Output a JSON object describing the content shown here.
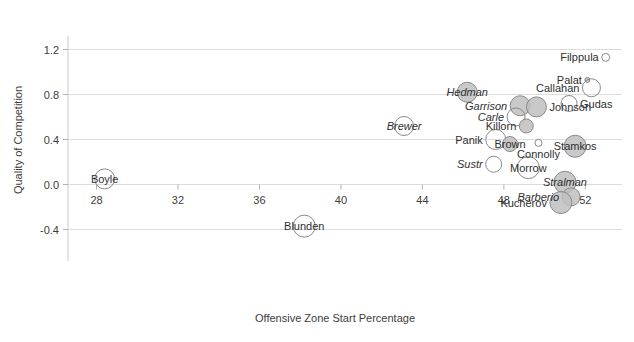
{
  "chart_data": {
    "type": "scatter",
    "title": "",
    "subtitle": "",
    "xlabel": "Offensive Zone Start Percentage",
    "ylabel": "Quality of Competition",
    "xlim": [
      26.6,
      53.8
    ],
    "ylim": [
      -0.52,
      1.32
    ],
    "xticks": [
      28,
      32,
      36,
      40,
      44,
      48,
      52
    ],
    "yticks": [
      1.2,
      0.8,
      0.4,
      0.0,
      -0.4
    ],
    "xtick_labels": [
      "28",
      "32",
      "36",
      "40",
      "44",
      "48",
      "52"
    ],
    "ytick_labels": [
      "1.2",
      "0.8",
      "0.4",
      "0.0",
      "-0.4"
    ],
    "grid": true,
    "grid_axis": "y",
    "legend": "none",
    "legend_position": "none",
    "marker_shape": "circle",
    "size_encoding": "bubble area (time on ice)",
    "style_note": "italic labels denote defensemen; shaded bubbles vs open bubbles",
    "colors": {
      "bubble_fill": "#bfbfbf",
      "bubble_stroke": "#8a8a8a",
      "grid": "#dcdcdc",
      "axis": "#c9c9c9",
      "text": "#3c3c3c"
    },
    "points": [
      {
        "label": "Filppula",
        "x": 53.0,
        "y": 1.13,
        "r": 4,
        "filled": false,
        "italic": false,
        "label_side": "left"
      },
      {
        "label": "Palat",
        "x": 52.1,
        "y": 0.93,
        "r": 2.5,
        "filled": true,
        "italic": false,
        "label_side": "left"
      },
      {
        "label": "Callahan",
        "x": 52.3,
        "y": 0.86,
        "r": 9,
        "filled": false,
        "italic": false,
        "label_side": "left"
      },
      {
        "label": "Hedman",
        "x": 46.2,
        "y": 0.82,
        "r": 10,
        "filled": true,
        "italic": true,
        "label_side": "center"
      },
      {
        "label": "Garrison",
        "x": 48.8,
        "y": 0.7,
        "r": 10,
        "filled": true,
        "italic": true,
        "label_side": "left"
      },
      {
        "label": "Johnson",
        "x": 49.6,
        "y": 0.69,
        "r": 10,
        "filled": true,
        "italic": false,
        "label_side": "right"
      },
      {
        "label": "Gudas",
        "x": 51.2,
        "y": 0.72,
        "r": 8,
        "filled": false,
        "italic": false,
        "label_side": "right"
      },
      {
        "label": "Carle",
        "x": 48.6,
        "y": 0.6,
        "r": 9,
        "filled": false,
        "italic": true,
        "label_side": "left"
      },
      {
        "label": "Brewer",
        "x": 43.1,
        "y": 0.52,
        "r": 9.5,
        "filled": false,
        "italic": true,
        "label_side": "center"
      },
      {
        "label": "Killorn",
        "x": 49.1,
        "y": 0.52,
        "r": 7,
        "filled": true,
        "italic": false,
        "label_side": "left"
      },
      {
        "label": "Panik",
        "x": 47.6,
        "y": 0.4,
        "r": 10,
        "filled": false,
        "italic": false,
        "label_side": "left"
      },
      {
        "label": "Brown",
        "x": 48.3,
        "y": 0.36,
        "r": 7.5,
        "filled": true,
        "italic": false,
        "label_side": "center"
      },
      {
        "label": "Connolly",
        "x": 49.7,
        "y": 0.37,
        "r": 3.5,
        "filled": false,
        "italic": false,
        "label_side": "below"
      },
      {
        "label": "Stamkos",
        "x": 51.5,
        "y": 0.34,
        "r": 11,
        "filled": true,
        "italic": false,
        "label_side": "center"
      },
      {
        "label": "Sustr",
        "x": 47.5,
        "y": 0.18,
        "r": 8,
        "filled": false,
        "italic": true,
        "label_side": "left"
      },
      {
        "label": "Morrow",
        "x": 49.2,
        "y": 0.15,
        "r": 11,
        "filled": false,
        "italic": false,
        "label_side": "center"
      },
      {
        "label": "Boyle",
        "x": 28.4,
        "y": 0.05,
        "r": 10,
        "filled": false,
        "italic": false,
        "label_side": "center"
      },
      {
        "label": "Stralman",
        "x": 51.0,
        "y": 0.02,
        "r": 11,
        "filled": true,
        "italic": true,
        "label_side": "center"
      },
      {
        "label": "Barberio",
        "x": 51.3,
        "y": -0.11,
        "r": 9,
        "filled": true,
        "italic": true,
        "label_side": "left"
      },
      {
        "label": "Kucherov",
        "x": 50.8,
        "y": -0.16,
        "r": 11,
        "filled": true,
        "italic": false,
        "label_side": "left"
      },
      {
        "label": "Blunden",
        "x": 38.2,
        "y": -0.37,
        "r": 11,
        "filled": false,
        "italic": false,
        "label_side": "center"
      }
    ]
  }
}
